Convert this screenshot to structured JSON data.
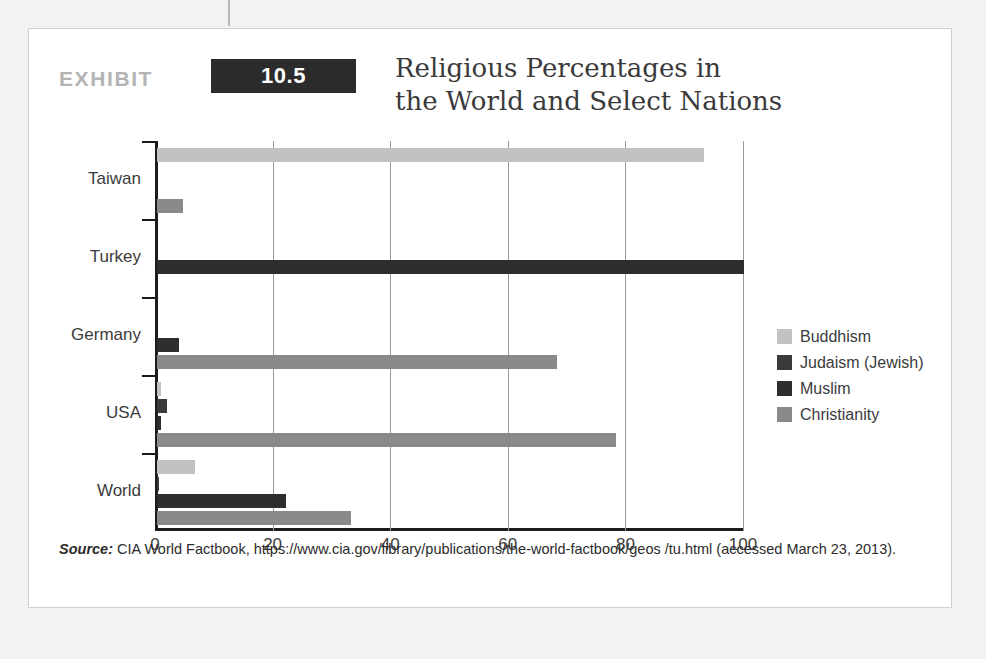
{
  "exhibit": {
    "label": "EXHIBIT",
    "number": "10.5",
    "title": "Religious Percentages in\nthe World and Select Nations"
  },
  "source": {
    "label": "Source:",
    "text": "CIA World Factbook, https://www.cia.gov/library/publications/the-world-factbook/geos /tu.html (accessed March 23, 2013)."
  },
  "legend": {
    "position": "right",
    "items": [
      {
        "label": "Buddhism",
        "color": "#c2c2c2"
      },
      {
        "label": "Judaism (Jewish)",
        "color": "#3a3a3a"
      },
      {
        "label": "Muslim",
        "color": "#2e2e2e"
      },
      {
        "label": "Christianity",
        "color": "#8a8a8a"
      }
    ]
  },
  "chart_data": {
    "type": "bar",
    "orientation": "horizontal",
    "title": "Religious Percentages in the World and Select Nations",
    "xlabel": "",
    "ylabel": "",
    "xlim": [
      0,
      100
    ],
    "xticks": [
      0,
      20,
      40,
      60,
      80,
      100
    ],
    "xtick_labels": [
      "0",
      "20",
      "40",
      "60",
      "80",
      "100"
    ],
    "grid": true,
    "grid_axis": "x",
    "legend_position": "right",
    "categories": [
      "World",
      "USA",
      "Germany",
      "Turkey",
      "Taiwan"
    ],
    "series": [
      {
        "name": "Buddhism",
        "color": "#c2c2c2",
        "values": [
          6.5,
          0.7,
          0,
          0,
          93
        ]
      },
      {
        "name": "Judaism (Jewish)",
        "color": "#3a3a3a",
        "values": [
          0.2,
          1.7,
          0,
          0,
          0
        ]
      },
      {
        "name": "Muslim",
        "color": "#2e2e2e",
        "values": [
          22,
          0.6,
          3.7,
          99.8,
          0
        ]
      },
      {
        "name": "Christianity",
        "color": "#8a8a8a",
        "values": [
          33,
          78,
          68,
          0,
          4.5
        ]
      }
    ]
  }
}
